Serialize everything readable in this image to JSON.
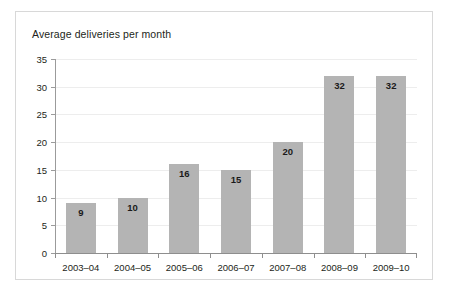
{
  "chart_data": {
    "type": "bar",
    "title": "Average deliveries per month",
    "xlabel": "",
    "ylabel": "",
    "ylim": [
      0,
      35
    ],
    "ytick_step": 5,
    "yticks": [
      0,
      5,
      10,
      15,
      20,
      25,
      30,
      35
    ],
    "grid": true,
    "legend": false,
    "categories": [
      "2003–04",
      "2004–05",
      "2005–06",
      "2006–07",
      "2007–08",
      "2008–09",
      "2009–10"
    ],
    "values": [
      9,
      10,
      16,
      15,
      20,
      32,
      32
    ],
    "data_labels": [
      "9",
      "10",
      "16",
      "15",
      "20",
      "32",
      "32"
    ],
    "colors": {
      "bar_fill": "#b4b4b4",
      "axis": "#8e8e8e",
      "gridline": "#ededed",
      "text": "#231f20",
      "border": "#d8d8d8",
      "background": "#ffffff"
    }
  }
}
